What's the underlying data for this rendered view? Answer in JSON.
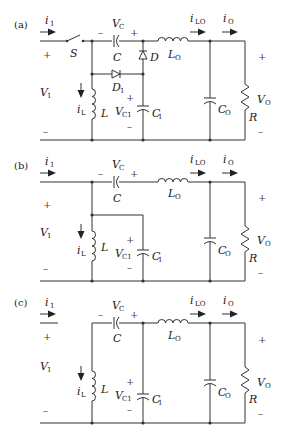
{
  "figure": {
    "panels": [
      {
        "id": "a",
        "label": "(a)",
        "components": [
          "S",
          "C",
          "D",
          "D1",
          "L",
          "C1",
          "LO",
          "CO",
          "R"
        ],
        "labels": {
          "i1": "i",
          "i1_sub": "1",
          "S": "S",
          "VC": "V",
          "VC_sub": "C",
          "C": "C",
          "D": "D",
          "D1": "D",
          "D1_sub": "1",
          "LO": "L",
          "LO_sub": "O",
          "iLO": "i",
          "iLO_sub": "LO",
          "iO": "i",
          "iO_sub": "O",
          "V1": "V",
          "V1_sub": "1",
          "iL": "i",
          "iL_sub": "L",
          "L": "L",
          "VC1": "V",
          "VC1_sub": "C1",
          "C1": "C",
          "C1_sub": "1",
          "CO": "C",
          "CO_sub": "O",
          "R": "R",
          "VO": "V",
          "VO_sub": "O",
          "plus": "+",
          "minus": "–"
        }
      },
      {
        "id": "b",
        "label": "(b)",
        "components": [
          "C",
          "L",
          "C1",
          "LO",
          "CO",
          "R"
        ],
        "labels": {
          "i1": "i",
          "i1_sub": "1",
          "VC": "V",
          "VC_sub": "C",
          "C": "C",
          "LO": "L",
          "LO_sub": "O",
          "iLO": "i",
          "iLO_sub": "LO",
          "iO": "i",
          "iO_sub": "O",
          "V1": "V",
          "V1_sub": "1",
          "iL": "i",
          "iL_sub": "L",
          "L": "L",
          "VC1": "V",
          "VC1_sub": "C1",
          "C1": "C",
          "C1_sub": "1",
          "CO": "C",
          "CO_sub": "O",
          "R": "R",
          "VO": "V",
          "VO_sub": "O",
          "plus": "+",
          "minus": "–"
        }
      },
      {
        "id": "c",
        "label": "(c)",
        "components": [
          "C",
          "L",
          "C1",
          "LO",
          "CO",
          "R"
        ],
        "labels": {
          "i1": "i",
          "i1_sub": "1",
          "VC": "V",
          "VC_sub": "C",
          "C": "C",
          "LO": "L",
          "LO_sub": "O",
          "iLO": "i",
          "iLO_sub": "LO",
          "iO": "i",
          "iO_sub": "O",
          "V1": "V",
          "V1_sub": "1",
          "iL": "i",
          "iL_sub": "L",
          "L": "L",
          "VC1": "V",
          "VC1_sub": "C1",
          "C1": "C",
          "C1_sub": "1",
          "CO": "C",
          "CO_sub": "O",
          "R": "R",
          "VO": "V",
          "VO_sub": "O",
          "plus": "+",
          "minus": "–"
        }
      }
    ]
  }
}
